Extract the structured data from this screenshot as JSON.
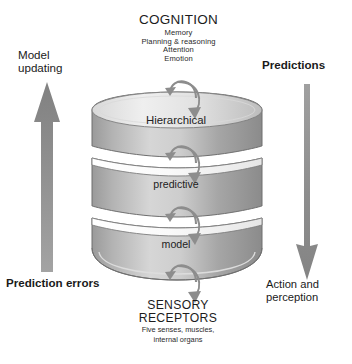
{
  "diagram": {
    "background": "#ffffff"
  },
  "top": {
    "heading": "COGNITION",
    "lines": [
      "Memory",
      "Planning & reasoning",
      "Attention",
      "Emotion"
    ]
  },
  "bottom": {
    "heading_line1": "SENSORY",
    "heading_line2": "RECEPTORS",
    "lines": [
      "Five senses, muscles,",
      "internal organs"
    ]
  },
  "left_flow": {
    "top_label": "Model updating",
    "bottom_label": "Prediction errors",
    "arrow_direction": "up",
    "arrow_color": "#8a8a8a"
  },
  "right_flow": {
    "top_label": "Predictions",
    "bottom_label": "Action and perception",
    "arrow_direction": "down",
    "arrow_color": "#8a8a8a"
  },
  "stack": {
    "segments": [
      {
        "label": "Hierarchical"
      },
      {
        "label": "predictive"
      },
      {
        "label": "model"
      }
    ],
    "fill_light": "#e9e9e9",
    "fill_dark": "#8f8f8f",
    "stroke": "#7a7a7a",
    "recursive_arrow_color": "#8c8c8c"
  }
}
